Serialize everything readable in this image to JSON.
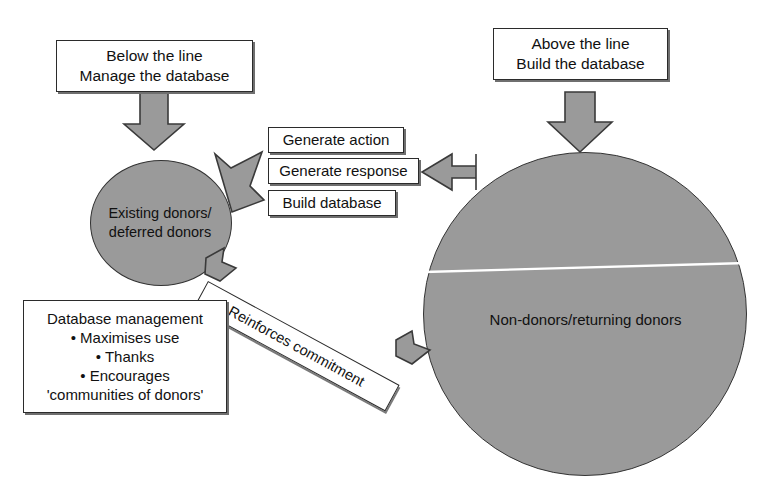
{
  "diagram": {
    "colors": {
      "fill_gray": "#9a9a9a",
      "outline": "#2b2b2b",
      "arrow_fill": "#9a9a9a",
      "arrow_outline": "#3a3a3a",
      "background": "#ffffff",
      "divider_line": "#ffffff"
    },
    "boxes": {
      "below_the_line": "Below the line\nManage the database",
      "above_the_line": "Above the line\nBuild the database",
      "generate_action": "Generate action",
      "generate_response": "Generate response",
      "build_database": "Build database",
      "database_management": "Database management\n• Maximises use\n• Thanks\n• Encourages\n'communities of donors'"
    },
    "circles": {
      "existing_donors": "Existing donors/\ndeferred donors",
      "non_donors": "Non-donors/returning donors"
    },
    "connectors": {
      "reinforces_commitment": "Reinforces commitment",
      "arrow_down_left_label": "down-arrow-below-line-to-existing-donors",
      "arrow_down_right_label": "down-arrow-above-line-to-non-donors",
      "arrow_diagonal_label": "diagonal-arrow-to-existing-donors",
      "arrow_left_label": "left-arrow-from-non-donors-to-actions"
    }
  }
}
